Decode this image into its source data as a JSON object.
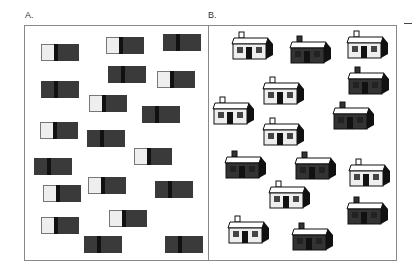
{
  "labels": {
    "a": "A.",
    "b": "B."
  },
  "colors": {
    "light": "#eeeeee",
    "dark": "#3a3a3a",
    "frame": "#888888"
  },
  "boxes": [
    {
      "x": 41,
      "y": 44,
      "type": "light"
    },
    {
      "x": 106,
      "y": 37,
      "type": "light"
    },
    {
      "x": 163,
      "y": 34,
      "type": "dark"
    },
    {
      "x": 108,
      "y": 66,
      "type": "dark"
    },
    {
      "x": 157,
      "y": 71,
      "type": "light"
    },
    {
      "x": 41,
      "y": 81,
      "type": "dark"
    },
    {
      "x": 89,
      "y": 95,
      "type": "light"
    },
    {
      "x": 142,
      "y": 106,
      "type": "dark"
    },
    {
      "x": 40,
      "y": 122,
      "type": "light"
    },
    {
      "x": 87,
      "y": 130,
      "type": "dark"
    },
    {
      "x": 134,
      "y": 148,
      "type": "light"
    },
    {
      "x": 34,
      "y": 158,
      "type": "dark"
    },
    {
      "x": 43,
      "y": 185,
      "type": "light"
    },
    {
      "x": 88,
      "y": 177,
      "type": "light"
    },
    {
      "x": 155,
      "y": 181,
      "type": "dark"
    },
    {
      "x": 41,
      "y": 217,
      "type": "light"
    },
    {
      "x": 109,
      "y": 210,
      "type": "light"
    },
    {
      "x": 84,
      "y": 236,
      "type": "dark"
    },
    {
      "x": 165,
      "y": 236,
      "type": "dark"
    }
  ],
  "houses": [
    {
      "x": 230,
      "y": 31,
      "type": "light"
    },
    {
      "x": 288,
      "y": 35,
      "type": "dark"
    },
    {
      "x": 345,
      "y": 30,
      "type": "light"
    },
    {
      "x": 346,
      "y": 66,
      "type": "dark"
    },
    {
      "x": 261,
      "y": 76,
      "type": "light"
    },
    {
      "x": 211,
      "y": 96,
      "type": "light"
    },
    {
      "x": 331,
      "y": 101,
      "type": "dark"
    },
    {
      "x": 261,
      "y": 117,
      "type": "light"
    },
    {
      "x": 223,
      "y": 150,
      "type": "dark"
    },
    {
      "x": 293,
      "y": 151,
      "type": "dark"
    },
    {
      "x": 347,
      "y": 158,
      "type": "light"
    },
    {
      "x": 267,
      "y": 180,
      "type": "light"
    },
    {
      "x": 345,
      "y": 196,
      "type": "dark"
    },
    {
      "x": 226,
      "y": 215,
      "type": "light"
    },
    {
      "x": 290,
      "y": 222,
      "type": "dark"
    }
  ]
}
